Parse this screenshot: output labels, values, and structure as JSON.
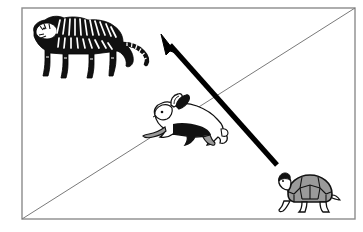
{
  "figure": {
    "axis": {
      "y_label": "length of legs",
      "x_label": ""
    },
    "frame": {
      "left": 22,
      "top": 8,
      "right": 355,
      "bottom": 219,
      "border_color": "#8c8c8c"
    },
    "reference_line": {
      "name": "diagonal-reference-line",
      "from": [
        22,
        219
      ],
      "to": [
        355,
        8
      ],
      "color": "#7a7a7a",
      "width": 1
    },
    "trend_arrow": {
      "name": "trend-arrow",
      "direction": "up-left",
      "tail": [
        277,
        165
      ],
      "tip": [
        161,
        35
      ],
      "color": "#000000",
      "width": 5
    },
    "animals": [
      {
        "name": "tiger",
        "label": "tiger",
        "x": 28,
        "y": 14,
        "width": 100,
        "height": 68,
        "fill": "#111111",
        "accent": "#ffffff"
      },
      {
        "name": "hare",
        "label": "hare",
        "x": 143,
        "y": 93,
        "width": 85,
        "height": 62,
        "fill": "#ffffff",
        "accent": "#111111"
      },
      {
        "name": "tortoise",
        "label": "tortoise",
        "x": 272,
        "y": 168,
        "width": 72,
        "height": 50,
        "fill": "#9a9a9a",
        "accent": "#111111"
      }
    ],
    "background_color": "#ffffff"
  },
  "chart_data": {
    "type": "scatter",
    "title": "",
    "xlabel": "",
    "ylabel": "length of legs",
    "grid": false,
    "legend": null,
    "xlim": [
      0,
      1
    ],
    "ylim": [
      0,
      1
    ],
    "points": [
      {
        "label": "tiger",
        "x": 0.2,
        "y": 0.85
      },
      {
        "label": "hare",
        "x": 0.5,
        "y": 0.5
      },
      {
        "label": "tortoise",
        "x": 0.88,
        "y": 0.12
      }
    ],
    "annotations": [
      {
        "type": "line",
        "label": "diagonal reference line",
        "from": [
          0,
          0
        ],
        "to": [
          1,
          1
        ]
      },
      {
        "type": "arrow",
        "label": "trend arrow pointing toward longer legs",
        "from": [
          0.77,
          0.26
        ],
        "to": [
          0.42,
          0.87
        ]
      }
    ]
  }
}
